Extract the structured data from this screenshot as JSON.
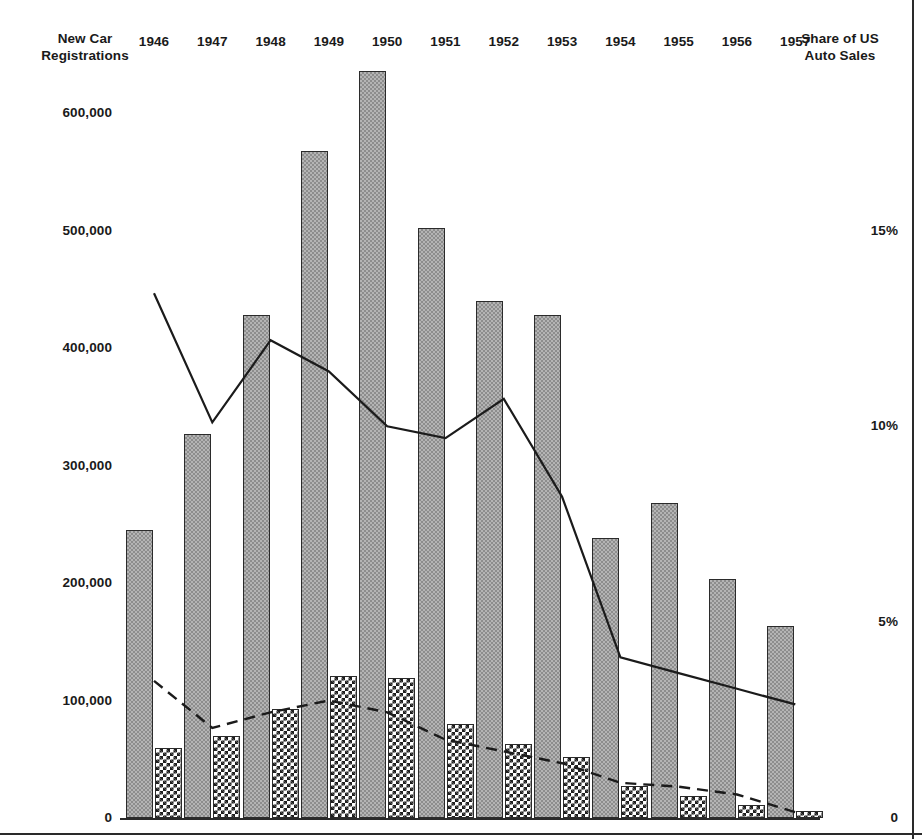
{
  "axes": {
    "left_title": "New Car\nRegistrations",
    "right_title": "Share of US\nAuto Sales",
    "left_ticks": [
      "600,000",
      "500,000",
      "400,000",
      "300,000",
      "200,000",
      "100,000",
      "0"
    ],
    "right_ticks": [
      "15%",
      "10%",
      "5%",
      "0"
    ]
  },
  "years": [
    "1946",
    "1947",
    "1948",
    "1949",
    "1950",
    "1951",
    "1952",
    "1953",
    "1954",
    "1955",
    "1956",
    "1957"
  ],
  "chart_data": {
    "type": "bar",
    "title": "",
    "subtitle": "",
    "xlabel": "",
    "ylabel": "New Car Registrations",
    "y2label": "Share of US Auto Sales",
    "categories": [
      "1946",
      "1947",
      "1948",
      "1949",
      "1950",
      "1951",
      "1952",
      "1953",
      "1954",
      "1955",
      "1956",
      "1957"
    ],
    "ylim": [
      0,
      700000
    ],
    "y2lim": [
      0,
      18
    ],
    "yticks": [
      0,
      100000,
      200000,
      300000,
      400000,
      500000,
      600000
    ],
    "ytick_labels": [
      "0",
      "100,000",
      "200,000",
      "300,000",
      "400,000",
      "500,000",
      "600,000"
    ],
    "y2ticks": [
      0,
      5,
      10,
      15
    ],
    "y2tick_labels": [
      "0",
      "5%",
      "10%",
      "15%"
    ],
    "grid": false,
    "legend": "none",
    "series": [
      {
        "name": "New car registrations (light bar)",
        "type": "bar",
        "axis": "left",
        "style": "light-checker",
        "values": [
          245000,
          327000,
          428000,
          568000,
          636000,
          502000,
          440000,
          428000,
          238000,
          268000,
          203000,
          163000
        ]
      },
      {
        "name": "New car registrations (dark bar)",
        "type": "bar",
        "axis": "left",
        "style": "dark-checker",
        "values": [
          60000,
          70000,
          93000,
          121000,
          119000,
          80000,
          63000,
          52000,
          27000,
          19000,
          11000,
          6000
        ]
      },
      {
        "name": "Share of US auto sales (solid line)",
        "type": "line",
        "axis": "right",
        "style": "solid",
        "values": [
          13.4,
          10.1,
          12.2,
          11.4,
          10.0,
          9.7,
          10.7,
          8.2,
          4.1,
          3.7,
          3.3,
          2.9
        ]
      },
      {
        "name": "Share of US auto sales (dashed line)",
        "type": "line",
        "axis": "right",
        "style": "dashed",
        "values": [
          3.5,
          2.3,
          2.7,
          3.0,
          2.7,
          2.0,
          1.7,
          1.4,
          0.9,
          0.8,
          0.6,
          0.15
        ]
      }
    ]
  },
  "geometry": {
    "plot_left": 120,
    "plot_right": 820,
    "baseline_y": 818,
    "value_600k_y": 113,
    "pair_pitch": 58.3,
    "bar_width": 27,
    "bar_gap": 2
  }
}
